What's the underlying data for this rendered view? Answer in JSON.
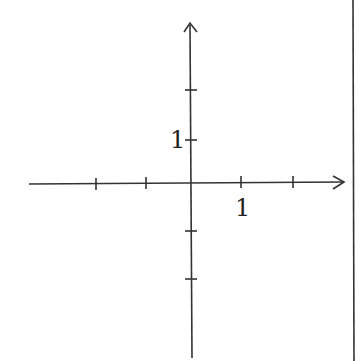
{
  "diagram": {
    "type": "coordinate-axes",
    "x_axis": {
      "tick_positions": [
        -2,
        -1,
        1,
        2
      ],
      "label": "1",
      "label_at": 1,
      "arrow": "right"
    },
    "y_axis": {
      "tick_positions": [
        2,
        1,
        -1,
        -2
      ],
      "label": "1",
      "label_at": 1,
      "arrow": "up"
    },
    "line_color": "#333333"
  }
}
